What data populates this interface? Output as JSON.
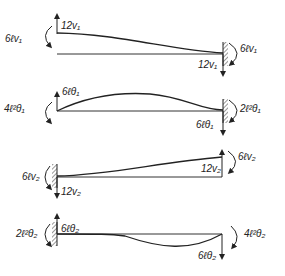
{
  "diagram": {
    "type": "beam-deflection-shapes",
    "panels": [
      {
        "id": "v1",
        "left_moment": "6ℓv₁",
        "left_force": "12v₁",
        "right_moment": "6ℓv₁",
        "right_force": "12v₁",
        "support": "right-fixed"
      },
      {
        "id": "theta1",
        "left_moment": "4ℓ²θ₁",
        "left_force": "6ℓθ₁",
        "right_moment": "2ℓ²θ₁",
        "right_force": "6ℓθ₁",
        "support": "right-fixed"
      },
      {
        "id": "v2",
        "left_moment": "6ℓv₂",
        "left_force": "12v₂",
        "right_moment": "6ℓv₂",
        "right_force": "12v₂",
        "support": "left-fixed"
      },
      {
        "id": "theta2",
        "left_moment": "2ℓ²θ₂",
        "left_force": "6ℓθ₂",
        "right_moment": "4ℓ²θ₂",
        "right_force": "6ℓθ₂",
        "support": "left-fixed"
      }
    ]
  }
}
